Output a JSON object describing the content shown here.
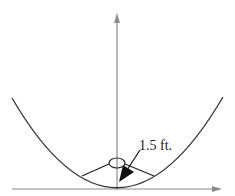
{
  "diagram": {
    "type": "parabolic-reflector",
    "focus_label": "1.5 ft.",
    "colors": {
      "curve": "#333333",
      "axis": "#8a8a8a",
      "text": "#222222",
      "arrow": "#111111",
      "background": "#ffffff"
    },
    "elements": {
      "vertical_axis": "y-axis with arrow pointing up",
      "horizontal_axis": "x-axis with arrow pointing right",
      "parabola": "upward-opening parabola with vertex at origin",
      "focus": "small ellipse at the focal point on the axis",
      "rays": "two line segments from focus to the parabola",
      "dimension_arrow": "arrow indicating 1.5 ft. distance from vertex to focus"
    }
  }
}
